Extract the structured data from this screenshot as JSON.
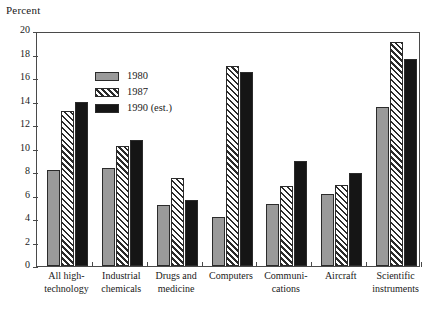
{
  "chart_data": {
    "type": "bar",
    "title": "",
    "ylabel": "Percent",
    "xlabel": "",
    "ylim": [
      0,
      20
    ],
    "yticks": [
      0,
      2,
      4,
      6,
      8,
      10,
      12,
      14,
      16,
      18,
      20
    ],
    "grid": false,
    "legend_position": "top-left inside plot area",
    "categories": [
      "All high-\ntechnology",
      "Industrial\nchemicals",
      "Drugs and\nmedicine",
      "Computers",
      "Communi-\ncations",
      "Aircraft",
      "Scientific\ninstruments"
    ],
    "series": [
      {
        "name": "1980",
        "fill": "solid-gray",
        "color": "#9a9a9a",
        "values": [
          8.2,
          8.3,
          5.2,
          4.2,
          5.3,
          6.1,
          13.5
        ]
      },
      {
        "name": "1987",
        "fill": "diagonal-hatch",
        "color": "#ffffff",
        "values": [
          13.2,
          10.2,
          7.5,
          17.0,
          6.8,
          6.9,
          19.1
        ]
      },
      {
        "name": "1990 (est.)",
        "fill": "solid-black",
        "color": "#151515",
        "values": [
          14.0,
          10.7,
          5.6,
          16.5,
          8.9,
          7.9,
          17.6
        ]
      }
    ]
  },
  "legend": {
    "items": [
      {
        "label": "1980"
      },
      {
        "label": "1987"
      },
      {
        "label": "1990 (est.)"
      }
    ]
  }
}
